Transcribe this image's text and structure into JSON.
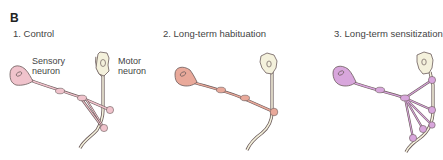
{
  "figure": {
    "panel_letter": "B",
    "panels": [
      {
        "title": "1. Control",
        "labels": {
          "sensory_line1": "Sensory",
          "sensory_line2": "neuron",
          "motor_line1": "Motor",
          "motor_line2": "neuron"
        },
        "sensory_color": "#f0c3cc",
        "varicosity_count": 4
      },
      {
        "title": "2. Long-term habituation",
        "sensory_color": "#e9a99a",
        "varicosity_count": 3
      },
      {
        "title": "3. Long-term sensitization",
        "sensory_color": "#d8a6dc",
        "varicosity_count": 8
      }
    ],
    "colors": {
      "motor_fill": "#f4f1dc",
      "outline": "#6a5a5a"
    }
  }
}
